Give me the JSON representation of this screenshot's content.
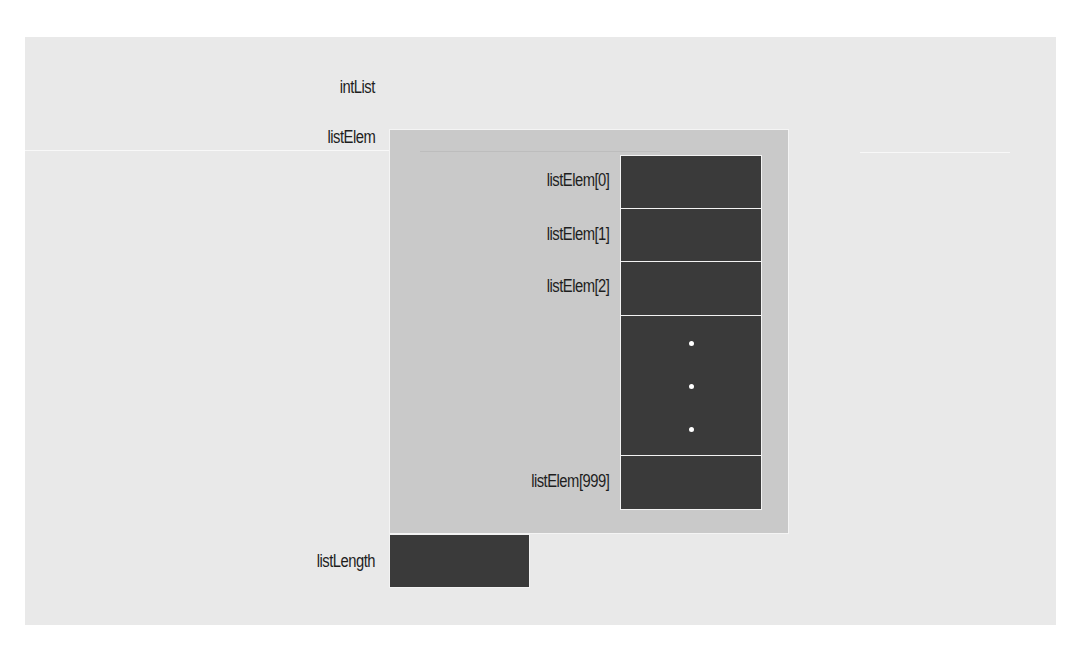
{
  "diagram": {
    "variable_name": "intList",
    "members": [
      {
        "name": "listElem",
        "type": "array"
      },
      {
        "name": "listLength",
        "type": "scalar"
      }
    ],
    "array_elements": [
      {
        "label": "listElem[0]"
      },
      {
        "label": "listElem[1]"
      },
      {
        "label": "listElem[2]"
      },
      {
        "label": "",
        "ellipsis": true
      },
      {
        "label": "listElem[999]"
      }
    ],
    "colors": {
      "background": "#e9e9e9",
      "struct_fill": "#c9c9c9",
      "cell_fill": "#3a3a3a",
      "text": "#1e1e1e"
    }
  }
}
